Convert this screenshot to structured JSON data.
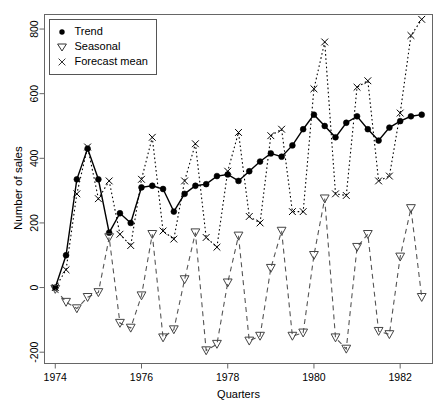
{
  "chart_data": {
    "type": "line",
    "title": "",
    "xlabel": "Quarters",
    "ylabel": "Number of sales",
    "xlim": [
      1973.75,
      1982.75
    ],
    "ylim": [
      -235,
      845
    ],
    "xticks": [
      1974,
      1976,
      1978,
      1980,
      1982
    ],
    "xticklabels": [
      "1974",
      "1976",
      "1978",
      "1980",
      "1982"
    ],
    "yticks": [
      -200,
      0,
      200,
      400,
      600,
      800
    ],
    "yticklabels": [
      "-200",
      "0",
      "200",
      "400",
      "600",
      "800"
    ],
    "grid": false,
    "legend_position": "top-left",
    "x": [
      1974.0,
      1974.25,
      1974.5,
      1974.75,
      1975.0,
      1975.25,
      1975.5,
      1975.75,
      1976.0,
      1976.25,
      1976.5,
      1976.75,
      1977.0,
      1977.25,
      1977.5,
      1977.75,
      1978.0,
      1978.25,
      1978.5,
      1978.75,
      1979.0,
      1979.25,
      1979.5,
      1979.75,
      1980.0,
      1980.25,
      1980.5,
      1980.75,
      1981.0,
      1981.25,
      1981.5,
      1981.75,
      1982.0,
      1982.25,
      1982.5
    ],
    "series": [
      {
        "name": "Trend",
        "marker": "filled-circle",
        "linestyle": "solid",
        "color": "#000000",
        "values": [
          0,
          100,
          335,
          430,
          335,
          170,
          230,
          200,
          310,
          315,
          305,
          235,
          290,
          315,
          320,
          345,
          350,
          330,
          360,
          390,
          415,
          405,
          440,
          490,
          535,
          500,
          465,
          510,
          530,
          490,
          455,
          495,
          515,
          530,
          535
        ]
      },
      {
        "name": "Seasonal",
        "marker": "open-triangle-down",
        "linestyle": "dashed",
        "color": "#555555",
        "values": [
          -5,
          -45,
          -65,
          -30,
          -15,
          155,
          -110,
          -125,
          -25,
          165,
          -155,
          -130,
          25,
          170,
          -195,
          -175,
          15,
          160,
          -165,
          -150,
          60,
          175,
          -150,
          -140,
          100,
          275,
          -155,
          -190,
          125,
          165,
          -135,
          -145,
          95,
          245,
          -30
        ]
      },
      {
        "name": "Forecast mean",
        "marker": "cross-x",
        "linestyle": "dotted",
        "color": "#000000",
        "values": [
          0,
          55,
          290,
          435,
          275,
          330,
          165,
          130,
          335,
          465,
          175,
          150,
          330,
          445,
          155,
          125,
          360,
          480,
          220,
          200,
          470,
          490,
          235,
          235,
          615,
          760,
          290,
          285,
          620,
          640,
          330,
          345,
          540,
          780,
          830
        ]
      }
    ],
    "legend": [
      {
        "label": "Trend",
        "symbol": "filled-circle"
      },
      {
        "label": "Seasonal",
        "symbol": "open-triangle-down"
      },
      {
        "label": "Forecast mean",
        "symbol": "cross-x"
      }
    ]
  }
}
